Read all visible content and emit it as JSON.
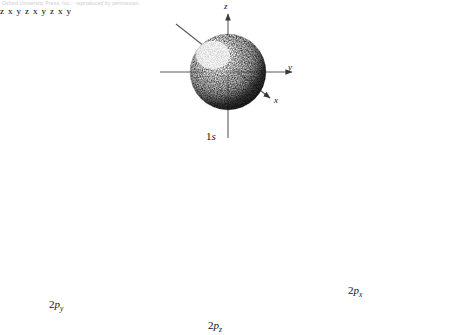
{
  "header": {
    "text": "Oxford University Press, Inc.  ·  reproduced by permission"
  },
  "figure": {
    "background_color": "#ffffff",
    "ink_color": "#111111",
    "axis_color": "#555555",
    "stipple_color": "#2b2b2b",
    "orbitals": [
      {
        "id": "1s",
        "label_main": "1",
        "label_sub": "s",
        "shape": "sphere",
        "description": "spherical stippled electron cloud centered on origin",
        "center": {
          "x": 228,
          "y": 72
        },
        "radius": 38,
        "highlight": {
          "x": 212,
          "y": 54,
          "r": 16
        },
        "axes": [
          {
            "name": "z",
            "label": "z",
            "dir": "up",
            "length": 66,
            "label_pos": {
              "x": 225,
              "y": 2
            }
          },
          {
            "name": "y",
            "label": "y",
            "dir": "right",
            "length": 108,
            "label_pos": {
              "x": 288,
              "y": 66
            }
          },
          {
            "name": "x",
            "label": "x",
            "dir": "down-right-45",
            "length": 62,
            "label_pos": {
              "x": 275,
              "y": 98
            }
          },
          {
            "name": "x-back",
            "label": "",
            "dir": "up-left-45",
            "length": 72,
            "label_pos": null
          }
        ],
        "label_pos": {
          "x": 206,
          "y": 131
        }
      },
      {
        "id": "2py",
        "label_main": "2",
        "label_sub": "y",
        "label_italic": "p",
        "shape": "dumbbell-diagonal",
        "description": "two teardrop lobes along the diagonal y axis, upper-right and lower-left",
        "center": {
          "x": 75,
          "y": 243
        },
        "lobe_length": 62,
        "lobe_width": 40,
        "lobe_angle_deg": -32,
        "axes": [
          {
            "name": "z",
            "label": "z",
            "dir": "up",
            "length": 48,
            "label_pos": {
              "x": 72,
              "y": 193
            }
          },
          {
            "name": "x",
            "label": "x",
            "dir": "right",
            "length": 72,
            "label_pos": {
              "x": 124,
              "y": 237
            }
          },
          {
            "name": "x-left",
            "label": "",
            "dir": "left",
            "length": 74,
            "label_pos": null
          },
          {
            "name": "y",
            "label": "y",
            "dir": "up-right-32",
            "length": 80,
            "label_pos": {
              "x": 143,
              "y": 193
            }
          },
          {
            "name": "y-back",
            "label": "",
            "dir": "down-left-32",
            "length": 78,
            "label_pos": null
          },
          {
            "name": "z-down",
            "label": "",
            "dir": "down",
            "length": 62,
            "label_pos": null
          }
        ],
        "label_pos": {
          "x": 49,
          "y": 299
        }
      },
      {
        "id": "2pz",
        "label_main": "2",
        "label_sub": "z",
        "label_italic": "p",
        "shape": "dumbbell-vertical",
        "description": "two teardrop lobes above and below the origin along the vertical z axis",
        "center": {
          "x": 218,
          "y": 248
        },
        "lobe_length": 68,
        "lobe_width": 44,
        "lobe_angle_deg": 90,
        "axes": [
          {
            "name": "z",
            "label": "z",
            "dir": "up",
            "length": 92,
            "label_pos": {
              "x": 215,
              "y": 158
            }
          },
          {
            "name": "x",
            "label": "x",
            "dir": "right",
            "length": 52,
            "label_pos": {
              "x": 251,
              "y": 242
            }
          },
          {
            "name": "x-left",
            "label": "",
            "dir": "left",
            "length": 52,
            "label_pos": null
          },
          {
            "name": "y",
            "label": "y",
            "dir": "up-right-32",
            "length": 56,
            "label_pos": {
              "x": 255,
              "y": 216
            }
          },
          {
            "name": "y-back",
            "label": "",
            "dir": "down-left-32",
            "length": 54,
            "label_pos": null
          },
          {
            "name": "z-down",
            "label": "",
            "dir": "down",
            "length": 90,
            "label_pos": null
          }
        ],
        "label_pos": {
          "x": 208,
          "y": 320
        }
      },
      {
        "id": "2px",
        "label_main": "2",
        "label_sub": "x",
        "label_italic": "p",
        "shape": "dumbbell-horizontal",
        "description": "two rounded lobes left and right of the origin along the horizontal x axis",
        "center": {
          "x": 360,
          "y": 243
        },
        "lobe_length": 60,
        "lobe_width": 42,
        "lobe_angle_deg": 0,
        "axes": [
          {
            "name": "z",
            "label": "z",
            "dir": "up",
            "length": 52,
            "label_pos": {
              "x": 357,
              "y": 193
            }
          },
          {
            "name": "x",
            "label": "x",
            "dir": "right",
            "length": 84,
            "label_pos": {
              "x": 439,
              "y": 237
            }
          },
          {
            "name": "x-left",
            "label": "",
            "dir": "left",
            "length": 80,
            "label_pos": null
          },
          {
            "name": "y",
            "label": "y",
            "dir": "up-right-32",
            "length": 70,
            "label_pos": {
              "x": 422,
              "y": 198
            }
          },
          {
            "name": "y-back",
            "label": "",
            "dir": "down-left-32",
            "length": 66,
            "label_pos": null
          },
          {
            "name": "z-down",
            "label": "",
            "dir": "down",
            "length": 50,
            "label_pos": null
          }
        ],
        "label_pos": {
          "x": 348,
          "y": 285
        }
      }
    ]
  }
}
